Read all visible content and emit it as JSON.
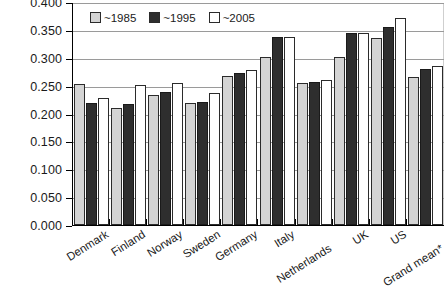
{
  "chart_data": {
    "type": "bar",
    "title": "",
    "subtitle": "",
    "xlabel": "",
    "ylabel": "",
    "ylim": [
      0.0,
      0.4
    ],
    "grid": true,
    "legend_position": "top-left",
    "categories": [
      "Denmark",
      "Finland",
      "Norway",
      "Sweden",
      "Germany",
      "Italy",
      "Netherlands",
      "UK",
      "US",
      "Grand mean*"
    ],
    "ticks": [
      "0.000",
      "0.050",
      "0.100",
      "0.150",
      "0.200",
      "0.250",
      "0.300",
      "0.350",
      "0.400"
    ],
    "tick_values": [
      0.0,
      0.05,
      0.1,
      0.15,
      0.2,
      0.25,
      0.3,
      0.35,
      0.4
    ],
    "series": [
      {
        "name": "~1985",
        "color": "#d4d4d4",
        "values": [
          0.253,
          0.209,
          0.233,
          0.218,
          0.267,
          0.302,
          0.254,
          0.302,
          0.335,
          0.265
        ]
      },
      {
        "name": "~1995",
        "color": "#2e2e2e",
        "values": [
          0.218,
          0.217,
          0.238,
          0.221,
          0.273,
          0.338,
          0.256,
          0.344,
          0.355,
          0.28
        ]
      },
      {
        "name": "~2005",
        "color": "#ffffff",
        "values": [
          0.228,
          0.252,
          0.255,
          0.237,
          0.278,
          0.338,
          0.261,
          0.345,
          0.372,
          0.286
        ]
      }
    ]
  }
}
